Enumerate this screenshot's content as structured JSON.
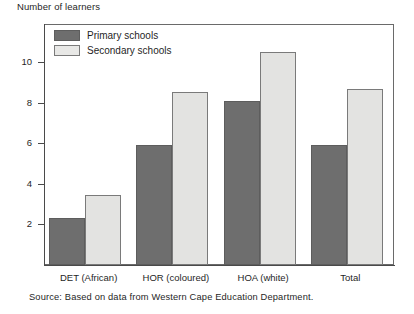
{
  "chart_data": {
    "type": "bar",
    "title": "",
    "ylabel": "Number of learners",
    "xlabel": "",
    "categories": [
      "DET (African)",
      "HOR (coloured)",
      "HOA (white)",
      "Total"
    ],
    "series": [
      {
        "name": "Primary schools",
        "values": [
          2.3,
          5.9,
          8.1,
          5.9
        ],
        "color": "#6e6e6e"
      },
      {
        "name": "Secondary schools",
        "values": [
          3.45,
          8.5,
          10.5,
          8.65
        ],
        "color": "#e3e3e1"
      }
    ],
    "ylim": [
      0,
      11.9
    ],
    "yticks": [
      2,
      4,
      6,
      8,
      10
    ],
    "ytick_labels": [
      "2",
      "4",
      "6",
      "8",
      "10"
    ],
    "grid": false,
    "legend_position": "top-left",
    "source": "Source: Based on data from Western Cape Education Department."
  },
  "legend": {
    "items": [
      {
        "label": "Primary schools",
        "swatch": "primary-swatch"
      },
      {
        "label": "Secondary schools",
        "swatch": "secondary-swatch"
      }
    ]
  },
  "colors": {
    "primary_fill": "#6e6e6e",
    "secondary_fill": "#e3e3e1",
    "axis": "#4a4a4a",
    "frame": "#6a6a6a",
    "text": "#1f1f1f"
  }
}
